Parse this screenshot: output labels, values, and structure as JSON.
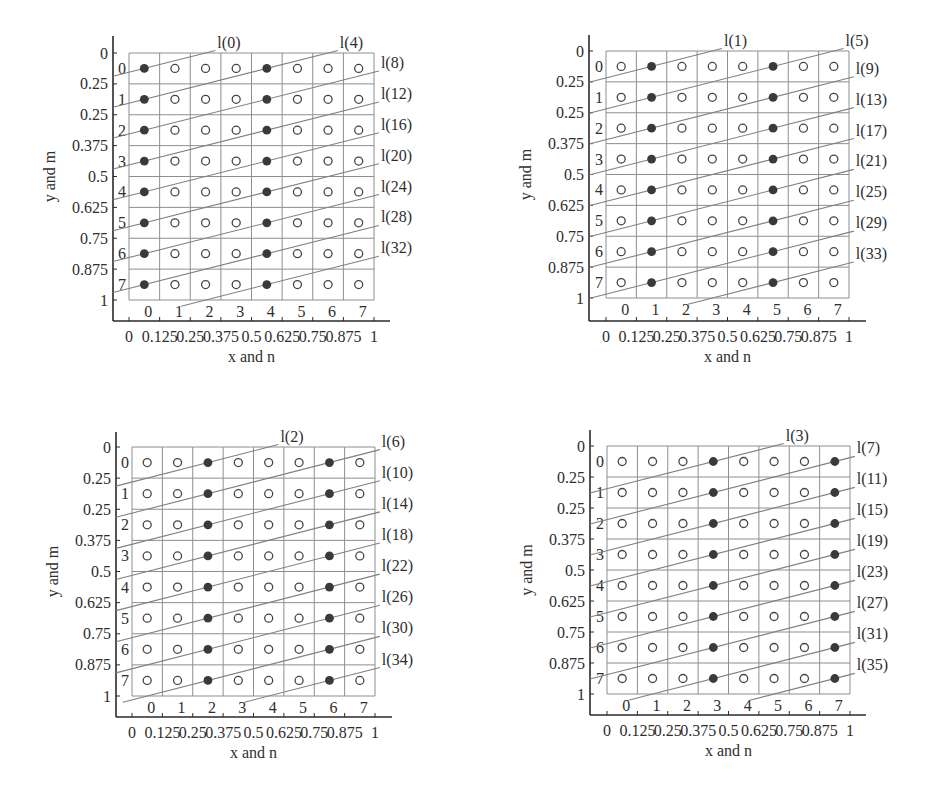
{
  "figure": {
    "panel_count": 4,
    "layout": "2x2"
  },
  "chart_data": [
    {
      "type": "scatter",
      "title": "",
      "xlabel": "x and n",
      "ylabel": "y and m",
      "xlim": [
        0,
        1
      ],
      "ylim": [
        0,
        1
      ],
      "y_axis_reversed": true,
      "grid": true,
      "grid_size": [
        8,
        8
      ],
      "x_ticks": [
        "0",
        "0.125",
        "0.25",
        "0.375",
        "0.5",
        "0.625",
        "0.75",
        "0.875",
        "1"
      ],
      "y_ticks": [
        "0",
        "0.25",
        "0.25",
        "0.375",
        "0.5",
        "0.625",
        "0.75",
        "0.875",
        "1"
      ],
      "column_labels": [
        "0",
        "1",
        "2",
        "3",
        "4",
        "5",
        "6",
        "7"
      ],
      "row_labels": [
        "0",
        "1",
        "2",
        "3",
        "4",
        "5",
        "6",
        "7"
      ],
      "filled_columns": [
        0,
        4
      ],
      "filled_points": [
        [
          0,
          0
        ],
        [
          4,
          0
        ],
        [
          0,
          1
        ],
        [
          4,
          1
        ],
        [
          0,
          2
        ],
        [
          4,
          2
        ],
        [
          0,
          3
        ],
        [
          4,
          3
        ],
        [
          0,
          4
        ],
        [
          4,
          4
        ],
        [
          0,
          5
        ],
        [
          4,
          5
        ],
        [
          0,
          6
        ],
        [
          4,
          6
        ],
        [
          0,
          7
        ],
        [
          4,
          7
        ]
      ],
      "line_slope_rows_per_column": -0.25,
      "lines": [
        {
          "label": "l(0)",
          "through": [
            0,
            0
          ]
        },
        {
          "label": "l(4)",
          "through": [
            0,
            1
          ]
        },
        {
          "label": "l(8)",
          "through": [
            0,
            2
          ]
        },
        {
          "label": "l(12)",
          "through": [
            0,
            3
          ]
        },
        {
          "label": "l(16)",
          "through": [
            0,
            4
          ]
        },
        {
          "label": "l(20)",
          "through": [
            0,
            5
          ]
        },
        {
          "label": "l(24)",
          "through": [
            0,
            6
          ]
        },
        {
          "label": "l(28)",
          "through": [
            0,
            7
          ]
        },
        {
          "label": "l(32)",
          "through": [
            4,
            7
          ]
        }
      ]
    },
    {
      "type": "scatter",
      "title": "",
      "xlabel": "x and n",
      "ylabel": "y and m",
      "xlim": [
        0,
        1
      ],
      "ylim": [
        0,
        1
      ],
      "y_axis_reversed": true,
      "grid": true,
      "grid_size": [
        8,
        8
      ],
      "x_ticks": [
        "0",
        "0.125",
        "0.25",
        "0.375",
        "0.5",
        "0.625",
        "0.75",
        "0.875",
        "1"
      ],
      "y_ticks": [
        "0",
        "0.25",
        "0.25",
        "0.375",
        "0.5",
        "0.625",
        "0.75",
        "0.875",
        "1"
      ],
      "column_labels": [
        "0",
        "1",
        "2",
        "3",
        "4",
        "5",
        "6",
        "7"
      ],
      "row_labels": [
        "0",
        "1",
        "2",
        "3",
        "4",
        "5",
        "6",
        "7"
      ],
      "filled_columns": [
        1,
        5
      ],
      "filled_points": [
        [
          1,
          0
        ],
        [
          5,
          0
        ],
        [
          1,
          1
        ],
        [
          5,
          1
        ],
        [
          1,
          2
        ],
        [
          5,
          2
        ],
        [
          1,
          3
        ],
        [
          5,
          3
        ],
        [
          1,
          4
        ],
        [
          5,
          4
        ],
        [
          1,
          5
        ],
        [
          5,
          5
        ],
        [
          1,
          6
        ],
        [
          5,
          6
        ],
        [
          1,
          7
        ],
        [
          5,
          7
        ]
      ],
      "line_slope_rows_per_column": -0.25,
      "lines": [
        {
          "label": "l(1)",
          "through": [
            1,
            0
          ]
        },
        {
          "label": "l(5)",
          "through": [
            1,
            1
          ]
        },
        {
          "label": "l(9)",
          "through": [
            1,
            2
          ]
        },
        {
          "label": "l(13)",
          "through": [
            1,
            3
          ]
        },
        {
          "label": "l(17)",
          "through": [
            1,
            4
          ]
        },
        {
          "label": "l(21)",
          "through": [
            1,
            5
          ]
        },
        {
          "label": "l(25)",
          "through": [
            1,
            6
          ]
        },
        {
          "label": "l(29)",
          "through": [
            1,
            7
          ]
        },
        {
          "label": "l(33)",
          "through": [
            5,
            7
          ]
        }
      ]
    },
    {
      "type": "scatter",
      "title": "",
      "xlabel": "x and n",
      "ylabel": "y and m",
      "xlim": [
        0,
        1
      ],
      "ylim": [
        0,
        1
      ],
      "y_axis_reversed": true,
      "grid": true,
      "grid_size": [
        8,
        8
      ],
      "x_ticks": [
        "0",
        "0.125",
        "0.25",
        "0.375",
        "0.5",
        "0.625",
        "0.75",
        "0.875",
        "1"
      ],
      "y_ticks": [
        "0",
        "0.25",
        "0.25",
        "0.375",
        "0.5",
        "0.625",
        "0.75",
        "0.875",
        "1"
      ],
      "column_labels": [
        "0",
        "1",
        "2",
        "3",
        "4",
        "5",
        "6",
        "7"
      ],
      "row_labels": [
        "0",
        "1",
        "2",
        "3",
        "4",
        "5",
        "6",
        "7"
      ],
      "filled_columns": [
        2,
        6
      ],
      "filled_points": [
        [
          2,
          0
        ],
        [
          6,
          0
        ],
        [
          2,
          1
        ],
        [
          6,
          1
        ],
        [
          2,
          2
        ],
        [
          6,
          2
        ],
        [
          2,
          3
        ],
        [
          6,
          3
        ],
        [
          2,
          4
        ],
        [
          6,
          4
        ],
        [
          2,
          5
        ],
        [
          6,
          5
        ],
        [
          2,
          6
        ],
        [
          6,
          6
        ],
        [
          2,
          7
        ],
        [
          6,
          7
        ]
      ],
      "line_slope_rows_per_column": -0.25,
      "lines": [
        {
          "label": "l(2)",
          "through": [
            2,
            0
          ]
        },
        {
          "label": "l(6)",
          "through": [
            2,
            1
          ]
        },
        {
          "label": "l(10)",
          "through": [
            2,
            2
          ]
        },
        {
          "label": "l(14)",
          "through": [
            2,
            3
          ]
        },
        {
          "label": "l(18)",
          "through": [
            2,
            4
          ]
        },
        {
          "label": "l(22)",
          "through": [
            2,
            5
          ]
        },
        {
          "label": "l(26)",
          "through": [
            2,
            6
          ]
        },
        {
          "label": "l(30)",
          "through": [
            2,
            7
          ]
        },
        {
          "label": "l(34)",
          "through": [
            6,
            7
          ]
        }
      ]
    },
    {
      "type": "scatter",
      "title": "",
      "xlabel": "x and n",
      "ylabel": "y and m",
      "xlim": [
        0,
        1
      ],
      "ylim": [
        0,
        1
      ],
      "y_axis_reversed": true,
      "grid": true,
      "grid_size": [
        8,
        8
      ],
      "x_ticks": [
        "0",
        "0.125",
        "0.25",
        "0.375",
        "0.5",
        "0.625",
        "0.75",
        "0.875",
        "1"
      ],
      "y_ticks": [
        "0",
        "0.25",
        "0.25",
        "0.375",
        "0.5",
        "0.625",
        "0.75",
        "0.875",
        "1"
      ],
      "column_labels": [
        "0",
        "1",
        "2",
        "3",
        "4",
        "5",
        "6",
        "7"
      ],
      "row_labels": [
        "0",
        "1",
        "2",
        "3",
        "4",
        "5",
        "6",
        "7"
      ],
      "filled_columns": [
        3,
        7
      ],
      "filled_points": [
        [
          3,
          0
        ],
        [
          7,
          0
        ],
        [
          3,
          1
        ],
        [
          7,
          1
        ],
        [
          3,
          2
        ],
        [
          7,
          2
        ],
        [
          3,
          3
        ],
        [
          7,
          3
        ],
        [
          3,
          4
        ],
        [
          7,
          4
        ],
        [
          3,
          5
        ],
        [
          7,
          5
        ],
        [
          3,
          6
        ],
        [
          7,
          6
        ],
        [
          3,
          7
        ],
        [
          7,
          7
        ]
      ],
      "line_slope_rows_per_column": -0.25,
      "lines": [
        {
          "label": "l(3)",
          "through": [
            3,
            0
          ]
        },
        {
          "label": "l(7)",
          "through": [
            3,
            1
          ]
        },
        {
          "label": "l(11)",
          "through": [
            3,
            2
          ]
        },
        {
          "label": "l(15)",
          "through": [
            3,
            3
          ]
        },
        {
          "label": "l(19)",
          "through": [
            3,
            4
          ]
        },
        {
          "label": "l(23)",
          "through": [
            3,
            5
          ]
        },
        {
          "label": "l(27)",
          "through": [
            3,
            6
          ]
        },
        {
          "label": "l(31)",
          "through": [
            3,
            7
          ]
        },
        {
          "label": "l(35)",
          "through": [
            7,
            7
          ]
        }
      ]
    }
  ]
}
